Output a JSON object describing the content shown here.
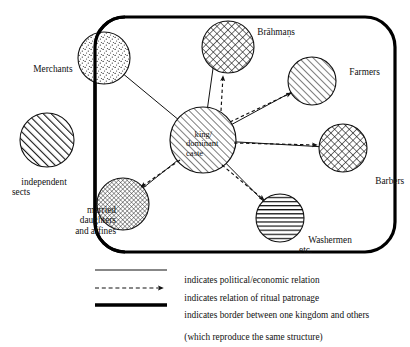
{
  "diagram": {
    "colors": {
      "ink": "#111111",
      "background": "#ffffff",
      "border": "#000000"
    },
    "border": {
      "name": "kingdom-border",
      "shape": "rounded-rectangle",
      "x": 95,
      "y": 17,
      "width": 300,
      "height": 235,
      "radius": 30,
      "stroke_width": 3.2
    },
    "nodes": [
      {
        "id": "independent-sects",
        "label": "independent\nsects",
        "cx": 47,
        "cy": 140,
        "r": 27,
        "pattern": "diagonal-hatch-bold",
        "label_x": 12,
        "label_y": 172,
        "inside_border": false
      },
      {
        "id": "merchants",
        "label": "Merchants",
        "cx": 104,
        "cy": 58,
        "r": 26,
        "pattern": "stipple",
        "label_x": 24,
        "label_y": 53,
        "inside_border": "straddles"
      },
      {
        "id": "brahmans",
        "label": "Brāhmaṇs",
        "cx": 228,
        "cy": 47,
        "r": 26,
        "pattern": "cross-hatch",
        "label_x": 248,
        "label_y": 22,
        "inside_border": true
      },
      {
        "id": "farmers",
        "label": "Farmers",
        "cx": 312,
        "cy": 81,
        "r": 24,
        "pattern": "diagonal-hatch",
        "label_x": 340,
        "label_y": 61,
        "inside_border": true
      },
      {
        "id": "barbers",
        "label": "Barbers",
        "cx": 343,
        "cy": 148,
        "r": 24,
        "pattern": "cross-hatch",
        "label_x": 366,
        "label_y": 169,
        "inside_border": true
      },
      {
        "id": "king-dominant-caste",
        "label": "king/\ndominant\ncaste",
        "cx": 203,
        "cy": 140,
        "r": 33,
        "pattern": "diagonal-hatch",
        "label_x": 188,
        "label_y": 123,
        "inside_border": true
      },
      {
        "id": "washermen",
        "label": "Washermen\netc.",
        "cx": 280,
        "cy": 218,
        "r": 24,
        "pattern": "horizontal-lines",
        "label_x": 300,
        "label_y": 229,
        "inside_border": true
      },
      {
        "id": "married-daughters-and-affines",
        "label": "married\ndaughters\nand affines",
        "cx": 123,
        "cy": 204,
        "r": 26,
        "pattern": "fine-mesh",
        "label_x": 57,
        "label_y": 198,
        "inside_border": "straddles"
      }
    ],
    "edges": [
      {
        "id": "king-merchants",
        "from": "king-dominant-caste",
        "to": "merchants",
        "style": "solid",
        "arrow": false
      },
      {
        "id": "king-brahmans-solid",
        "from": "king-dominant-caste",
        "to": "brahmans",
        "style": "solid",
        "arrow": false
      },
      {
        "id": "king-brahmans-ritual",
        "from": "king-dominant-caste",
        "to": "brahmans",
        "style": "dashed",
        "arrow": true
      },
      {
        "id": "king-farmers-solid",
        "from": "king-dominant-caste",
        "to": "farmers",
        "style": "solid",
        "arrow": false
      },
      {
        "id": "king-farmers-ritual",
        "from": "king-dominant-caste",
        "to": "farmers",
        "style": "dashed",
        "arrow": true
      },
      {
        "id": "king-barbers-solid",
        "from": "king-dominant-caste",
        "to": "barbers",
        "style": "solid",
        "arrow": false
      },
      {
        "id": "king-barbers-ritual",
        "from": "king-dominant-caste",
        "to": "barbers",
        "style": "dashed",
        "arrow": true
      },
      {
        "id": "king-washermen-solid",
        "from": "king-dominant-caste",
        "to": "washermen",
        "style": "solid",
        "arrow": false
      },
      {
        "id": "king-washermen-ritual",
        "from": "king-dominant-caste",
        "to": "washermen",
        "style": "dashed",
        "arrow": true
      },
      {
        "id": "king-married-daughters-solid",
        "from": "king-dominant-caste",
        "to": "married-daughters-and-affines",
        "style": "solid",
        "arrow": false
      },
      {
        "id": "king-married-daughters-ritual",
        "from": "king-dominant-caste",
        "to": "married-daughters-and-affines",
        "style": "dashed",
        "arrow": true
      }
    ],
    "legend": {
      "items": [
        {
          "id": "legend-political",
          "sample": "solid-line",
          "text": "indicates political/economic relation"
        },
        {
          "id": "legend-ritual",
          "sample": "dashed-arrow",
          "text": "indicates relation of ritual patronage"
        },
        {
          "id": "legend-border",
          "sample": "thick-line",
          "text": "indicates border between one kingdom and others",
          "text_line2": "(which reproduce the same structure)"
        }
      ]
    }
  }
}
